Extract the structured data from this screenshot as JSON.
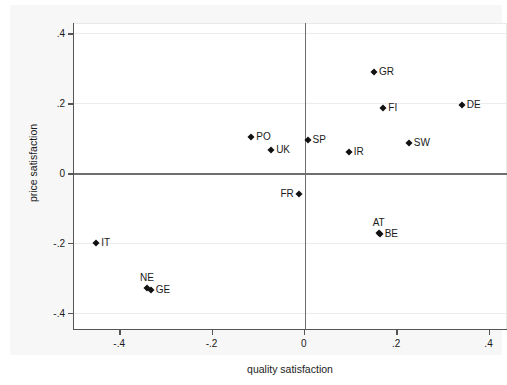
{
  "chart_data": {
    "type": "scatter",
    "title": "",
    "xlabel": "quality satisfaction",
    "ylabel": "price satisfaction",
    "xlim": [
      -0.5,
      0.44
    ],
    "ylim": [
      -0.45,
      0.43
    ],
    "xticks": [
      -0.4,
      -0.2,
      0,
      0.2,
      0.4
    ],
    "xtick_labels": [
      "-.4",
      "-.2",
      "0",
      ".2",
      ".4"
    ],
    "yticks": [
      -0.4,
      -0.2,
      0,
      0.2,
      0.4
    ],
    "ytick_labels": [
      "-.4",
      "-.2",
      "0",
      ".2",
      ".4"
    ],
    "grid": true,
    "legend": "none",
    "reference_lines": {
      "x": 0,
      "y": 0
    },
    "points": [
      {
        "label": "GR",
        "x": 0.15,
        "y": 0.29,
        "label_pos": "right"
      },
      {
        "label": "FI",
        "x": 0.17,
        "y": 0.185,
        "label_pos": "right"
      },
      {
        "label": "DE",
        "x": 0.34,
        "y": 0.195,
        "label_pos": "right"
      },
      {
        "label": "SW",
        "x": 0.225,
        "y": 0.085,
        "label_pos": "right"
      },
      {
        "label": "IR",
        "x": 0.095,
        "y": 0.06,
        "label_pos": "right"
      },
      {
        "label": "SP",
        "x": 0.006,
        "y": 0.095,
        "label_pos": "right"
      },
      {
        "label": "UK",
        "x": -0.073,
        "y": 0.067,
        "label_pos": "right"
      },
      {
        "label": "PO",
        "x": -0.116,
        "y": 0.103,
        "label_pos": "right"
      },
      {
        "label": "FR",
        "x": -0.013,
        "y": -0.06,
        "label_pos": "left"
      },
      {
        "label": "AT",
        "x": 0.16,
        "y": -0.172,
        "label_pos": "above"
      },
      {
        "label": "BE",
        "x": 0.162,
        "y": -0.176,
        "label_pos": "right"
      },
      {
        "label": "IT",
        "x": -0.452,
        "y": -0.2,
        "label_pos": "right"
      },
      {
        "label": "NE",
        "x": -0.342,
        "y": -0.331,
        "label_pos": "above"
      },
      {
        "label": "GE",
        "x": -0.334,
        "y": -0.335,
        "label_pos": "right"
      }
    ]
  }
}
